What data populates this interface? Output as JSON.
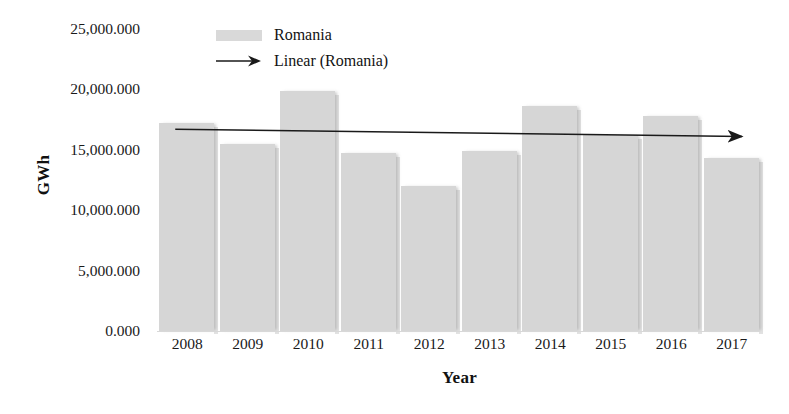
{
  "chart_data": {
    "type": "bar",
    "title": "",
    "xlabel": "Year",
    "ylabel": "GWh",
    "categories": [
      "2008",
      "2009",
      "2010",
      "2011",
      "2012",
      "2013",
      "2014",
      "2015",
      "2016",
      "2017"
    ],
    "series": [
      {
        "name": "Romania",
        "values": [
          17200,
          15500,
          19900,
          14700,
          12000,
          14900,
          18600,
          16200,
          17800,
          14300
        ]
      }
    ],
    "trendline": {
      "name": "Linear (Romania)",
      "start_value": 16700,
      "end_value": 16100,
      "style": "arrow-line",
      "color": "#1a1a1a"
    },
    "ylim": [
      0,
      25000
    ],
    "ytick_values": [
      0,
      5000,
      10000,
      15000,
      20000,
      25000
    ],
    "ytick_labels": [
      "0.000",
      "5,000.000",
      "10,000.000",
      "15,000.000",
      "20,000.000",
      "25,000.000"
    ],
    "grid": false,
    "legend_position": "top-center",
    "bar_color": "#d6d6d6",
    "legend": [
      {
        "label": "Romania",
        "marker": "swatch",
        "color": "#d9d9d9"
      },
      {
        "label": "Linear (Romania)",
        "marker": "arrow",
        "color": "#1a1a1a"
      }
    ]
  }
}
